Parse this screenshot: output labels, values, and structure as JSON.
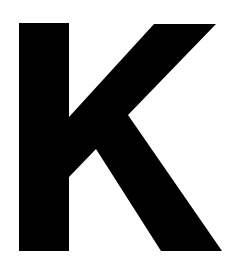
{
  "image": {
    "glyph": "K",
    "foreground_color": "#000000",
    "background_color": "#ffffff"
  }
}
